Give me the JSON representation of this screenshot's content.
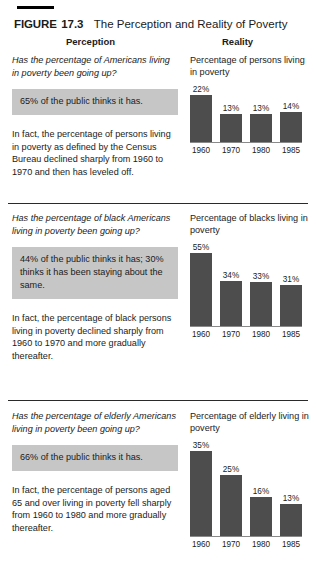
{
  "figure": {
    "label": "FIGURE",
    "number": "17.3",
    "title": "The Perception and Reality of Poverty"
  },
  "columns": {
    "perception_heading": "Perception",
    "reality_heading": "Reality"
  },
  "colors": {
    "bar": "#4d4d4d",
    "highlight_background": "#c6c6c6",
    "rule": "#000000",
    "axis": "#8a8a8a",
    "text": "#1b1b1b"
  },
  "sections": [
    {
      "question": "Has the percentage of Americans living in poverty been going up?",
      "highlight": "65% of the public thinks it has.",
      "fact": "In fact, the percentage of persons living in poverty as defined by the Census Bureau declined sharply from 1960 to 1970 and then has leveled off.",
      "chart_caption": "Percentage of persons living in poverty"
    },
    {
      "question": "Has the percentage of black Americans living in poverty been going up?",
      "highlight": "44% of the public thinks it has; 30% thinks it has been staying about the same.",
      "fact": "In fact, the percentage of black persons living in poverty declined sharply from 1960 to 1970 and more gradually thereafter.",
      "chart_caption": "Percentage of blacks living in poverty"
    },
    {
      "question": "Has the percentage of elderly Americans living in poverty been going up?",
      "highlight": "66% of the public thinks it has.",
      "fact": "In fact, the percentage of persons aged 65 and over living in poverty fell sharply from 1960 to 1980 and more gradually thereafter.",
      "chart_caption": "Percentage of elderly living in poverty"
    }
  ],
  "chart_data": [
    {
      "type": "bar",
      "title": "Percentage of persons living in poverty",
      "categories": [
        "1960",
        "1970",
        "1980",
        "1985"
      ],
      "values": [
        22,
        13,
        13,
        14
      ],
      "labels": [
        "22%",
        "13%",
        "13%",
        "14%"
      ],
      "xlabel": "",
      "ylabel": "",
      "ylim": [
        0,
        22
      ],
      "grid": false,
      "legend": false
    },
    {
      "type": "bar",
      "title": "Percentage of blacks living in poverty",
      "categories": [
        "1960",
        "1970",
        "1980",
        "1985"
      ],
      "values": [
        55,
        34,
        33,
        31
      ],
      "labels": [
        "55%",
        "34%",
        "33%",
        "31%"
      ],
      "xlabel": "",
      "ylabel": "",
      "ylim": [
        0,
        55
      ],
      "grid": false,
      "legend": false
    },
    {
      "type": "bar",
      "title": "Percentage of elderly living in poverty",
      "categories": [
        "1960",
        "1970",
        "1980",
        "1985"
      ],
      "values": [
        35,
        25,
        16,
        13
      ],
      "labels": [
        "35%",
        "25%",
        "16%",
        "13%"
      ],
      "xlabel": "",
      "ylabel": "",
      "ylim": [
        0,
        35
      ],
      "grid": false,
      "legend": false
    }
  ]
}
